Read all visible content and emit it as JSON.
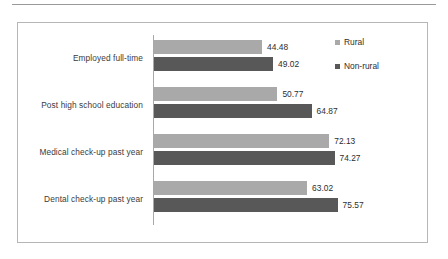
{
  "chart_data": {
    "type": "bar",
    "orientation": "horizontal",
    "title": "",
    "xlabel": "",
    "ylabel": "",
    "categories": [
      "Employed full-time",
      "Post high school education",
      "Medical check-up past year",
      "Dental check-up past year"
    ],
    "series": [
      {
        "name": "Rural",
        "color": "#a9a9a9",
        "values": [
          44.48,
          50.77,
          72.13,
          63.02
        ],
        "labels": [
          "44.48",
          "50.77",
          "72.13",
          "63.02"
        ]
      },
      {
        "name": "Non-rural",
        "color": "#585858",
        "values": [
          49.02,
          64.87,
          74.27,
          75.57
        ],
        "labels": [
          "49.02",
          "64.87",
          "74.27",
          "75.57"
        ]
      }
    ],
    "xlim": [
      0,
      80
    ],
    "grid": false,
    "legend_position": "right",
    "data_labels": true
  },
  "legend": {
    "items": [
      {
        "label": "Rural",
        "swatch": "rural"
      },
      {
        "label": "Non-rural",
        "swatch": "nonrural"
      }
    ]
  },
  "colors": {
    "rural": "#a9a9a9",
    "nonrural": "#585858",
    "frame": "#b6b6b6",
    "axis": "#a9a9a9",
    "text": "#2e2e2e"
  }
}
